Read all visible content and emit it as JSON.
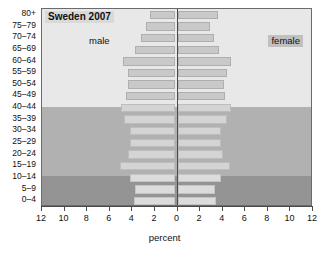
{
  "chart_data": {
    "type": "bar",
    "subtype": "population-pyramid",
    "title": "Sweden 2007",
    "xlabel": "percent",
    "ylabel": "",
    "categories": [
      "80+",
      "75–79",
      "70–74",
      "65–69",
      "60–64",
      "55–59",
      "50–54",
      "45–49",
      "40–44",
      "35–39",
      "30–34",
      "25–29",
      "20–24",
      "15–19",
      "10–14",
      "5–9",
      "0–4"
    ],
    "series": [
      {
        "name": "male",
        "side": "left",
        "values": [
          2.2,
          2.6,
          3.0,
          3.5,
          4.6,
          4.2,
          4.2,
          4.3,
          4.8,
          4.5,
          4.0,
          4.0,
          4.2,
          4.9,
          4.0,
          3.5,
          3.6
        ]
      },
      {
        "name": "female",
        "side": "right",
        "values": [
          3.5,
          2.8,
          3.2,
          3.6,
          4.7,
          4.3,
          4.1,
          4.2,
          4.7,
          4.3,
          3.8,
          3.8,
          4.0,
          4.6,
          3.8,
          3.3,
          3.4
        ]
      }
    ],
    "xlim": [
      -12,
      12
    ],
    "xticks": [
      12,
      10,
      8,
      6,
      4,
      2,
      0,
      2,
      4,
      6,
      8,
      10,
      12
    ],
    "grid": false,
    "legend": [
      "male",
      "female"
    ],
    "legend_position": "inside-plot",
    "annotations": {
      "male_label": "male",
      "female_label": "female"
    },
    "bands": [
      {
        "name": "post-working-age",
        "categories": [
          "80+",
          "75–79",
          "70–74",
          "65–69",
          "60–64",
          "55–59",
          "50–54",
          "45–49"
        ],
        "color": "#e8e8e8"
      },
      {
        "name": "working-age",
        "categories": [
          "40–44",
          "35–39",
          "30–34",
          "25–29",
          "20–24",
          "15–19"
        ],
        "color": "#b1b1b1"
      },
      {
        "name": "children",
        "categories": [
          "10–14",
          "5–9",
          "0–4"
        ],
        "color": "#949494"
      }
    ],
    "colors": {
      "bar_old": "#c9c9c9",
      "bar_work": "#d4d4d4",
      "bar_young": "#dcdcdc",
      "axis": "#4a4a4a",
      "text": "#111111",
      "title_bg": "#d9d9d9",
      "female_label_bg": "#c0c0c0"
    }
  }
}
